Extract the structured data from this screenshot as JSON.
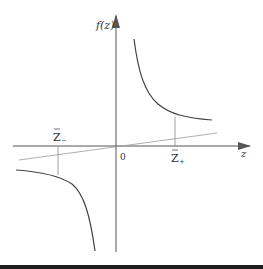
{
  "diagram": {
    "y_axis_label": "f(z)",
    "x_axis_label": "z",
    "origin_label": "0",
    "z_minus_label": {
      "base": "Z",
      "sub": "−",
      "bar": true
    },
    "z_plus_label": {
      "base": "Z",
      "sub": "+",
      "bar": true
    },
    "elements": [
      "hyperbola branch in first quadrant",
      "hyperbola branch in third quadrant",
      "straight line through origin with small positive slope",
      "vertical markers from x-axis to curve at Z- and Z+"
    ]
  },
  "colors": {
    "axis": "#555555",
    "curve": "#444444",
    "line": "#9a9a9a",
    "marker": "#8a8a8a",
    "band": "#1e1e1e"
  }
}
